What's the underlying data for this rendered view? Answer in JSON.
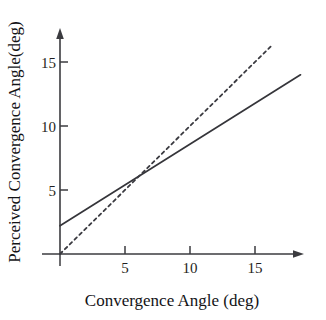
{
  "chart_data": {
    "type": "line",
    "title": "",
    "xlabel": "Convergence Angle (deg)",
    "ylabel": "Perceived Convergence Angle(deg)",
    "xlim": [
      0,
      18.5
    ],
    "ylim": [
      0,
      16.5
    ],
    "xticks": [
      5,
      10,
      15
    ],
    "yticks": [
      5,
      10,
      15
    ],
    "xtick_labels": [
      "5",
      "10",
      "15"
    ],
    "ytick_labels": [
      "5",
      "10",
      "15"
    ],
    "grid": false,
    "legend": "none",
    "axis_style": "arrow-ended L-shaped axes, origin at 0,0",
    "series": [
      {
        "name": "perceived-response",
        "style": "solid",
        "color": "#35353a",
        "description": "Measured perceived convergence angle; positive intercept, slope less than unity",
        "intercept": 2.2,
        "slope": 0.64,
        "x": [
          0,
          18.5
        ],
        "values": [
          2.2,
          14.0
        ]
      },
      {
        "name": "unity-reference",
        "style": "dashed",
        "color": "#3a3a40",
        "description": "Veridical y = x reference line",
        "intercept": 0,
        "slope": 1.0,
        "x": [
          0,
          16.2
        ],
        "values": [
          0,
          16.2
        ]
      }
    ],
    "annotations": [
      {
        "name": "crossover-point",
        "x": 5.3,
        "y": 5.3,
        "text": ""
      }
    ]
  },
  "axes": {
    "x_title": "Convergence Angle (deg)",
    "y_title": "Perceived Convergence Angle(deg)",
    "x_tick_labels": [
      "5",
      "10",
      "15"
    ],
    "y_tick_labels": [
      "5",
      "10",
      "15"
    ]
  },
  "colors": {
    "background": "#ffffff",
    "axis": "#3b3b3f",
    "solid_series": "#35353a",
    "dashed_series": "#3a3a40",
    "text": "#1a1a1a"
  }
}
